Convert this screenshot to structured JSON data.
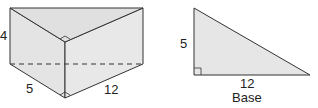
{
  "prism": {
    "label_height": "4",
    "label_leg_a": "5",
    "label_leg_b": "12"
  },
  "triangle": {
    "label_height": "5",
    "label_base_len": "12",
    "label_base": "Base"
  },
  "colors": {
    "fill": "#e6e6e6",
    "stroke": "#333333"
  }
}
